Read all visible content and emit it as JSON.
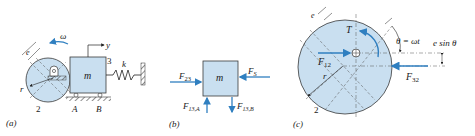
{
  "colors": {
    "fill": "#c9dff0",
    "stroke": "#3a3a3a",
    "arrow": "#2f7fc0",
    "ground": "#555555"
  },
  "panel_a": {
    "caption": "(a)",
    "omega": "ω",
    "eccentricity": "e",
    "radius": "r",
    "cam_number": "2",
    "slider_number": "3",
    "mass": "m",
    "spring": "k",
    "coordinate": "y",
    "support_a": "A",
    "support_b": "B"
  },
  "panel_b": {
    "caption": "(b)",
    "mass": "m",
    "f23": "F",
    "f23_sub": "23",
    "fs": "F",
    "fs_sub": "S",
    "f13a": "F",
    "f13a_sub": "13,A",
    "f13b": "F",
    "f13b_sub": "13,B"
  },
  "panel_c": {
    "caption": "(c)",
    "eccentricity": "e",
    "torque": "T",
    "angle": "θ = ωt",
    "offset": "e sin θ",
    "f12": "F",
    "f12_sub": "12",
    "f32": "F",
    "f32_sub": "32",
    "radius": "r",
    "cam_number": "2"
  }
}
